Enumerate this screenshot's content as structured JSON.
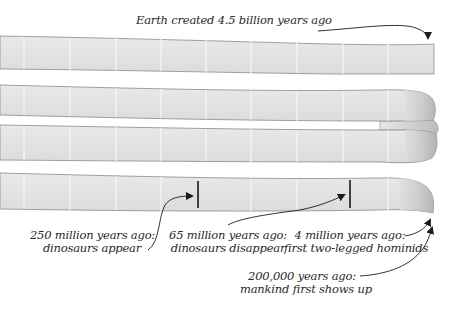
{
  "diagram": {
    "colors": {
      "strip_fill": "#e4e4e4",
      "strip_edge": "#8a8a8a",
      "divider": "#f7f7f7",
      "marker": "#1a1a1a",
      "text": "#2a2a2a",
      "background": "#ffffff"
    },
    "annotations": [
      {
        "id": "earth-created",
        "lines": [
          "Earth created 4.5 billion years ago"
        ]
      },
      {
        "id": "dinosaurs-appear",
        "lines": [
          "250 million years ago:",
          "dinosaurs appear"
        ]
      },
      {
        "id": "dinosaurs-disappear",
        "lines": [
          "65 million years ago:",
          "dinosaurs disappear"
        ]
      },
      {
        "id": "hominids",
        "lines": [
          "4 million years ago:",
          "first two-legged hominids"
        ]
      },
      {
        "id": "mankind",
        "lines": [
          "200,000 years ago:",
          "mankind first shows up"
        ]
      }
    ]
  }
}
